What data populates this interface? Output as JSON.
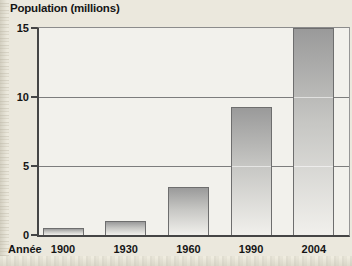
{
  "page": {
    "title": "Population (millions)",
    "x_axis_title": "Année"
  },
  "chart_data": {
    "type": "bar",
    "title": "Population (millions)",
    "categories": [
      "1900",
      "1930",
      "1960",
      "1990",
      "2004"
    ],
    "values": [
      0.5,
      1,
      3.5,
      9.3,
      15
    ],
    "xlabel": "Année",
    "ylabel": "Population (millions)",
    "ylim": [
      0,
      15
    ],
    "yticks": [
      0,
      5,
      10,
      15
    ],
    "grid": true,
    "legend": false,
    "bar_gradient_top": "#9a9a9a",
    "bar_gradient_bottom": "#f1f0ec",
    "bar_border_color": "#6e6e6e"
  },
  "colors": {
    "background": "#ebe8dd",
    "plot_background": "#f2f1ec",
    "gridline": "#7d7d7d",
    "axis": "#454545",
    "text": "#151515",
    "page_edge": "#ddd9cb"
  }
}
